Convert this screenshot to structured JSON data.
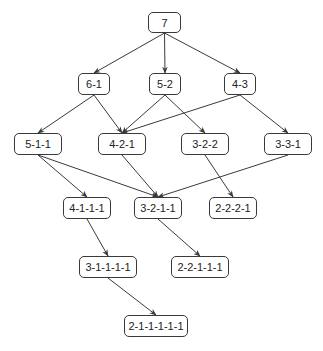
{
  "diagram": {
    "type": "partition-lattice",
    "nodes": [
      {
        "id": "n7",
        "label": "7",
        "x": 148,
        "y": 12,
        "w": 33,
        "h": 21
      },
      {
        "id": "n61",
        "label": "6-1",
        "x": 78,
        "y": 73,
        "w": 32,
        "h": 22
      },
      {
        "id": "n52",
        "label": "5-2",
        "x": 149,
        "y": 73,
        "w": 32,
        "h": 22
      },
      {
        "id": "n43",
        "label": "4-3",
        "x": 224,
        "y": 73,
        "w": 32,
        "h": 22
      },
      {
        "id": "n511",
        "label": "5-1-1",
        "x": 14,
        "y": 133,
        "w": 48,
        "h": 22
      },
      {
        "id": "n421",
        "label": "4-2-1",
        "x": 98,
        "y": 133,
        "w": 48,
        "h": 22
      },
      {
        "id": "n322",
        "label": "3-2-2",
        "x": 181,
        "y": 133,
        "w": 48,
        "h": 22
      },
      {
        "id": "n331",
        "label": "3-3-1",
        "x": 264,
        "y": 133,
        "w": 48,
        "h": 22
      },
      {
        "id": "n4111",
        "label": "4-1-1-1",
        "x": 63,
        "y": 197,
        "w": 48,
        "h": 22
      },
      {
        "id": "n3211",
        "label": "3-2-1-1",
        "x": 134,
        "y": 197,
        "w": 48,
        "h": 22
      },
      {
        "id": "n2221",
        "label": "2-2-2-1",
        "x": 209,
        "y": 197,
        "w": 48,
        "h": 22
      },
      {
        "id": "n31111",
        "label": "3-1-1-1-1",
        "x": 79,
        "y": 256,
        "w": 58,
        "h": 22
      },
      {
        "id": "n22111",
        "label": "2-2-1-1-1",
        "x": 171,
        "y": 256,
        "w": 58,
        "h": 22
      },
      {
        "id": "n211111",
        "label": "2-1-1-1-1-1",
        "x": 124,
        "y": 315,
        "w": 64,
        "h": 22
      }
    ],
    "edges": [
      [
        "n7",
        "n61"
      ],
      [
        "n7",
        "n52"
      ],
      [
        "n7",
        "n43"
      ],
      [
        "n61",
        "n511"
      ],
      [
        "n61",
        "n421"
      ],
      [
        "n52",
        "n421"
      ],
      [
        "n52",
        "n322"
      ],
      [
        "n43",
        "n421"
      ],
      [
        "n43",
        "n331"
      ],
      [
        "n511",
        "n4111"
      ],
      [
        "n511",
        "n3211"
      ],
      [
        "n421",
        "n3211"
      ],
      [
        "n322",
        "n2221"
      ],
      [
        "n331",
        "n3211"
      ],
      [
        "n4111",
        "n31111"
      ],
      [
        "n3211",
        "n22111"
      ],
      [
        "n31111",
        "n211111"
      ]
    ],
    "colors": {
      "line": "#3a3a3a",
      "box_border": "#3a3a3a",
      "text": "#222222",
      "background": "#ffffff"
    }
  }
}
